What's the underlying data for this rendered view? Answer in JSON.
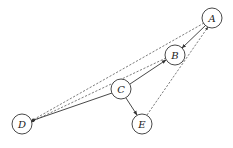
{
  "diagram": {
    "type": "directed-graph",
    "nodes": [
      {
        "id": "A",
        "label": "A",
        "x": 212,
        "y": 18
      },
      {
        "id": "B",
        "label": "B",
        "x": 175,
        "y": 55
      },
      {
        "id": "C",
        "label": "C",
        "x": 121,
        "y": 89
      },
      {
        "id": "D",
        "label": "D",
        "x": 22,
        "y": 124
      },
      {
        "id": "E",
        "label": "E",
        "x": 142,
        "y": 124
      }
    ],
    "edges": [
      {
        "from": "A",
        "to": "B",
        "style": "solid"
      },
      {
        "from": "C",
        "to": "B",
        "style": "solid"
      },
      {
        "from": "C",
        "to": "D",
        "style": "solid"
      },
      {
        "from": "C",
        "to": "E",
        "style": "solid"
      },
      {
        "from": "A",
        "to": "D",
        "style": "dashed"
      },
      {
        "from": "B",
        "to": "D",
        "style": "dashed"
      },
      {
        "from": "E",
        "to": "A",
        "style": "dashed"
      }
    ]
  }
}
